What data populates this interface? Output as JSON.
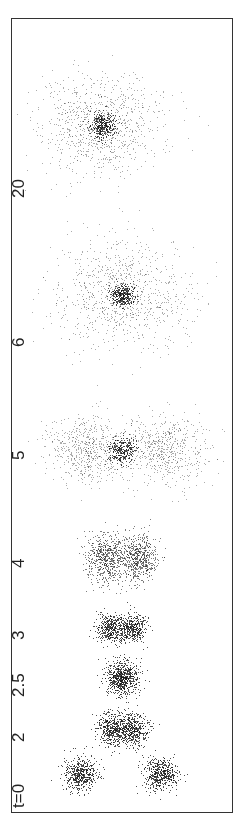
{
  "figure": {
    "panels": [
      {
        "label": "t=0",
        "t": 0,
        "y_center": 774,
        "clusters": [
          {
            "cx": 80,
            "r": 12,
            "n": 500,
            "type": "tight"
          },
          {
            "cx": 160,
            "r": 12,
            "n": 500,
            "type": "tight"
          }
        ]
      },
      {
        "label": "2",
        "t": 2,
        "y_center": 729,
        "clusters": [
          {
            "cx": 112,
            "r": 11,
            "n": 450,
            "type": "tight"
          },
          {
            "cx": 132,
            "r": 11,
            "n": 450,
            "type": "tight"
          }
        ]
      },
      {
        "label": "2.5",
        "t": 2.5,
        "y_center": 678,
        "clusters": [
          {
            "cx": 122,
            "r": 12,
            "n": 700,
            "type": "tight"
          }
        ]
      },
      {
        "label": "3",
        "t": 3,
        "y_center": 628,
        "clusters": [
          {
            "cx": 110,
            "r": 10,
            "n": 400,
            "type": "tight"
          },
          {
            "cx": 132,
            "r": 10,
            "n": 400,
            "type": "tight"
          }
        ]
      },
      {
        "label": "4",
        "t": 4,
        "y_center": 557,
        "clusters": [
          {
            "cx": 105,
            "r": 14,
            "n": 600,
            "type": "medium"
          },
          {
            "cx": 137,
            "r": 14,
            "n": 600,
            "type": "medium"
          }
        ]
      },
      {
        "label": "5",
        "t": 5,
        "y_center": 450,
        "clusters": [
          {
            "cx": 88,
            "r": 28,
            "n": 600,
            "type": "diffuse"
          },
          {
            "cx": 165,
            "r": 28,
            "n": 600,
            "type": "diffuse"
          },
          {
            "cx": 122,
            "r": 10,
            "n": 300,
            "type": "core"
          }
        ]
      },
      {
        "label": "6",
        "t": 6,
        "y_center": 295,
        "clusters": [
          {
            "cx": 122,
            "r": 45,
            "n": 900,
            "type": "diffuse"
          },
          {
            "cx": 122,
            "r": 8,
            "n": 350,
            "type": "core"
          }
        ]
      },
      {
        "label": "20",
        "t": 20,
        "y_center": 125,
        "clusters": [
          {
            "cx": 100,
            "r": 40,
            "n": 900,
            "type": "diffuse"
          },
          {
            "cx": 102,
            "r": 9,
            "n": 350,
            "type": "core"
          }
        ]
      }
    ],
    "label_positions": [
      {
        "label": "t=0",
        "y": 808
      },
      {
        "label": "2",
        "y": 742
      },
      {
        "label": "2.5",
        "y": 697
      },
      {
        "label": "3",
        "y": 640
      },
      {
        "label": "4",
        "y": 568
      },
      {
        "label": "5",
        "y": 460
      },
      {
        "label": "6",
        "y": 347
      },
      {
        "label": "20",
        "y": 198
      }
    ],
    "colors": {
      "ink": "#222222",
      "frame": "#333333",
      "background": "#ffffff"
    }
  }
}
